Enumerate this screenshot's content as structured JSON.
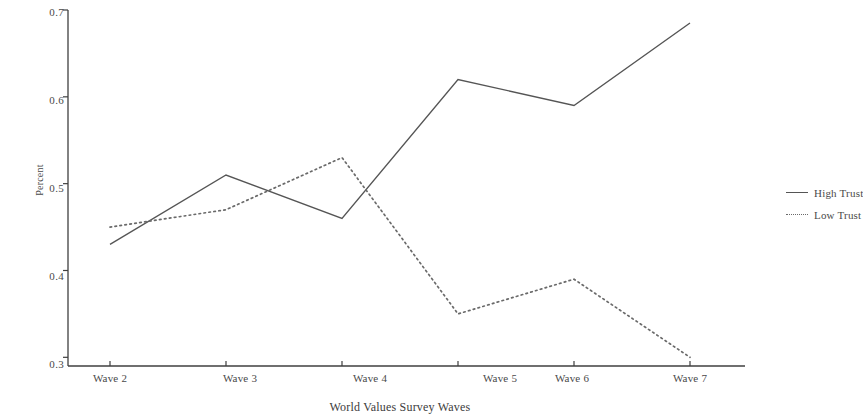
{
  "chart_data": {
    "type": "line",
    "title": "",
    "xlabel": "World Values Survey Waves",
    "ylabel": "Percent",
    "categories": [
      "Wave 2",
      "Wave 3",
      "Wave 4",
      "Wave 5",
      "Wave 6",
      "Wave 7"
    ],
    "series": [
      {
        "name": "High Trust",
        "style": "solid",
        "color": "#555555",
        "values": [
          0.43,
          0.51,
          0.46,
          0.62,
          0.59,
          0.685
        ]
      },
      {
        "name": "Low Trust",
        "style": "dotted",
        "color": "#6a6a6a",
        "values": [
          0.45,
          0.47,
          0.53,
          0.35,
          0.39,
          0.3
        ]
      }
    ],
    "ylim": [
      0.29,
      0.7
    ],
    "yticks": [
      "0.3",
      "0.4",
      "0.5",
      "0.6",
      "0.7"
    ],
    "ytick_values": [
      0.3,
      0.4,
      0.5,
      0.6,
      0.7
    ],
    "grid": false,
    "legend_position": "right"
  },
  "axes": {
    "y_label": "Percent",
    "x_label": "World Values Survey Waves"
  },
  "legend": {
    "entries": [
      {
        "label": "High Trust",
        "marker": "solid-line-swatch"
      },
      {
        "label": "Low Trust",
        "marker": "dotted-line-swatch"
      }
    ]
  }
}
